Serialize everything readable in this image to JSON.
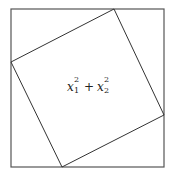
{
  "diagram": {
    "outer_square": {
      "x1": 11,
      "y1": 9,
      "x2": 164,
      "y2": 167,
      "stroke": "#444444"
    },
    "inner_square": {
      "points": [
        [
          114,
          9
        ],
        [
          164,
          115
        ],
        [
          62,
          167
        ],
        [
          11,
          62
        ]
      ],
      "stroke": "#333333"
    },
    "label": {
      "term1": {
        "base": "x",
        "sup": "2",
        "sub": "1"
      },
      "operator": "+",
      "term2": {
        "base": "x",
        "sup": "2",
        "sub": "2"
      },
      "full_text": "x1^2 + x2^2"
    }
  }
}
